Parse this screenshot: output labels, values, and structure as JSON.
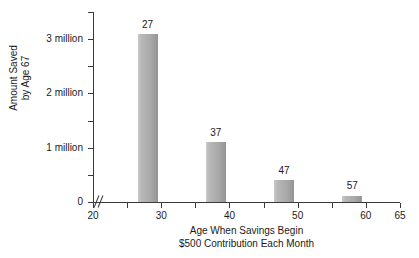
{
  "chart_data": {
    "type": "bar",
    "title": "",
    "xlabel": "Age When Savings Begin\n$500 Contribution Each Month",
    "xlabel_line1": "Age When Savings Begin",
    "xlabel_line2": "$500 Contribution Each Month",
    "ylabel": "Amount Saved\nby Age 67",
    "ylabel_line1": "Amount Saved",
    "ylabel_line2": "by Age 67",
    "categories": [
      27,
      37,
      47,
      57
    ],
    "values": [
      3.1,
      1.1,
      0.4,
      0.12
    ],
    "bar_labels": [
      "27",
      "37",
      "47",
      "57"
    ],
    "xlim": [
      20,
      65
    ],
    "ylim": [
      0,
      3.5
    ],
    "grid": false,
    "legend": null,
    "axis_break": true,
    "bar_color": "#ababab",
    "axis_color": "#3a3a3a",
    "background": "#ffffff",
    "x_ticks": [
      20,
      25,
      30,
      35,
      40,
      45,
      50,
      55,
      60,
      65
    ],
    "x_tick_labels": [
      {
        "value": 20,
        "text": "20"
      },
      {
        "value": 25,
        "text": ""
      },
      {
        "value": 30,
        "text": "30"
      },
      {
        "value": 35,
        "text": ""
      },
      {
        "value": 40,
        "text": "40"
      },
      {
        "value": 45,
        "text": ""
      },
      {
        "value": 50,
        "text": "50"
      },
      {
        "value": 55,
        "text": ""
      },
      {
        "value": 60,
        "text": "60"
      },
      {
        "value": 65,
        "text": "65"
      }
    ],
    "y_ticks": [
      0,
      0.5,
      1,
      1.5,
      2,
      2.5,
      3,
      3.5
    ],
    "y_tick_labels": [
      {
        "value": 0,
        "text": "0"
      },
      {
        "value": 0.5,
        "text": ""
      },
      {
        "value": 1,
        "text": "1 million"
      },
      {
        "value": 1.5,
        "text": ""
      },
      {
        "value": 2,
        "text": "2 million"
      },
      {
        "value": 2.5,
        "text": ""
      },
      {
        "value": 3,
        "text": "3 million"
      },
      {
        "value": 3.5,
        "text": ""
      }
    ]
  }
}
